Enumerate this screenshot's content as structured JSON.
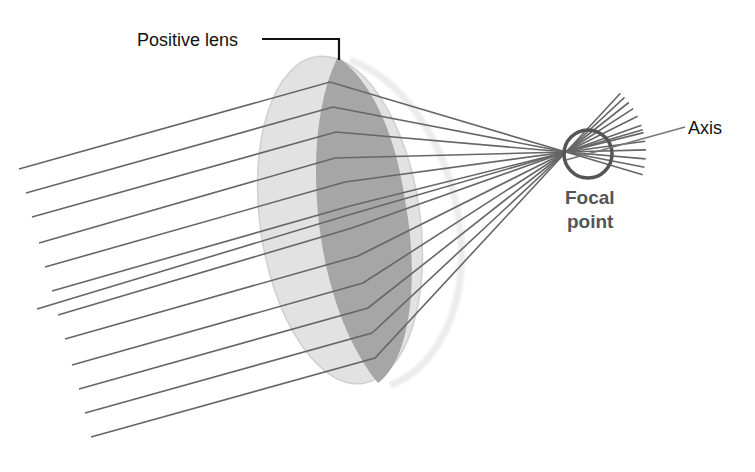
{
  "labels": {
    "lens": "Positive lens",
    "axis": "Axis",
    "focal_line1": "Focal",
    "focal_line2": "point"
  },
  "colors": {
    "ray": "#666666",
    "lens_light": "#e2e2e2",
    "lens_dark": "#a6a6a6",
    "lens_edge": "#f0f0f0",
    "focal_circle": "#555555",
    "focal_text": "#555555",
    "label_text": "#111111",
    "leader": "#111111"
  },
  "ray_count": 13
}
